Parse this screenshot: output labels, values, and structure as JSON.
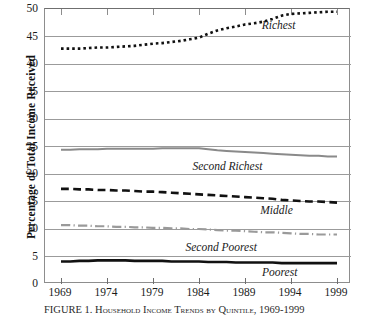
{
  "chart_data": {
    "type": "line",
    "title": "FIGURE 1.  Household Income Trends by Quintile, 1969-1999",
    "xlabel": "",
    "ylabel": "Percentage of Total Income Received",
    "xlim": [
      1969,
      1999
    ],
    "ylim": [
      0,
      50
    ],
    "grid": true,
    "legend_position": "inline-right",
    "x": [
      1969,
      1970,
      1971,
      1972,
      1973,
      1974,
      1975,
      1976,
      1977,
      1978,
      1979,
      1980,
      1981,
      1982,
      1983,
      1984,
      1985,
      1986,
      1987,
      1988,
      1989,
      1990,
      1991,
      1992,
      1993,
      1994,
      1995,
      1996,
      1997,
      1998,
      1999
    ],
    "xticks": [
      1969,
      1974,
      1979,
      1984,
      1989,
      1994,
      1999
    ],
    "xticklabels": [
      "1969",
      "1974",
      "1979",
      "1984",
      "1989",
      "1994",
      "1999"
    ],
    "yticks": [
      0,
      5,
      10,
      15,
      20,
      25,
      30,
      35,
      40,
      45,
      50
    ],
    "yticklabels": [
      "0",
      "5",
      "10",
      "15",
      "20",
      "25",
      "30",
      "35",
      "40",
      "45",
      "50"
    ],
    "series": [
      {
        "name": "Richest",
        "style": "dotted",
        "color": "#111111",
        "width": 2.6,
        "label_x": 1994.6,
        "label_y": 47.0,
        "values": [
          42.8,
          42.8,
          42.8,
          42.9,
          43.0,
          43.0,
          43.1,
          43.2,
          43.3,
          43.5,
          43.7,
          43.8,
          44.0,
          44.2,
          44.5,
          44.8,
          45.5,
          46.1,
          46.5,
          46.8,
          47.2,
          47.4,
          47.7,
          48.2,
          48.8,
          49.1,
          49.2,
          49.3,
          49.4,
          49.5,
          49.5
        ]
      },
      {
        "name": "Second Richest",
        "style": "solid",
        "color": "#8a8a8a",
        "width": 2.0,
        "label_x": 1991.0,
        "label_y": 21.2,
        "values": [
          24.4,
          24.4,
          24.5,
          24.5,
          24.5,
          24.6,
          24.6,
          24.6,
          24.6,
          24.6,
          24.6,
          24.7,
          24.7,
          24.7,
          24.7,
          24.7,
          24.5,
          24.3,
          24.2,
          24.1,
          24.0,
          23.9,
          23.8,
          23.7,
          23.6,
          23.5,
          23.4,
          23.3,
          23.3,
          23.2,
          23.2
        ]
      },
      {
        "name": "Middle",
        "style": "dashed",
        "color": "#111111",
        "width": 2.6,
        "label_x": 1994.3,
        "label_y": 13.2,
        "values": [
          17.3,
          17.3,
          17.2,
          17.2,
          17.1,
          17.1,
          17.0,
          17.0,
          16.9,
          16.8,
          16.8,
          16.7,
          16.6,
          16.5,
          16.4,
          16.3,
          16.2,
          16.1,
          16.0,
          15.9,
          15.8,
          15.7,
          15.6,
          15.5,
          15.3,
          15.2,
          15.1,
          15.0,
          15.0,
          14.9,
          14.8
        ]
      },
      {
        "name": "Second Poorest",
        "style": "dashdot",
        "color": "#9a9a9a",
        "width": 2.2,
        "label_x": 1990.4,
        "label_y": 6.5,
        "values": [
          10.7,
          10.7,
          10.6,
          10.6,
          10.5,
          10.5,
          10.4,
          10.4,
          10.3,
          10.3,
          10.2,
          10.2,
          10.1,
          10.1,
          10.0,
          10.0,
          9.9,
          9.8,
          9.7,
          9.7,
          9.6,
          9.5,
          9.4,
          9.4,
          9.3,
          9.2,
          9.1,
          9.1,
          9.0,
          9.0,
          9.0
        ]
      },
      {
        "name": "Poorest",
        "style": "solid",
        "color": "#111111",
        "width": 2.6,
        "label_x": 1994.8,
        "label_y": 2.0,
        "values": [
          4.1,
          4.1,
          4.2,
          4.2,
          4.3,
          4.3,
          4.3,
          4.3,
          4.2,
          4.2,
          4.2,
          4.2,
          4.1,
          4.1,
          4.1,
          4.1,
          4.0,
          4.0,
          4.0,
          3.9,
          3.9,
          3.9,
          3.9,
          3.9,
          3.8,
          3.8,
          3.8,
          3.8,
          3.8,
          3.8,
          3.8
        ]
      }
    ]
  }
}
